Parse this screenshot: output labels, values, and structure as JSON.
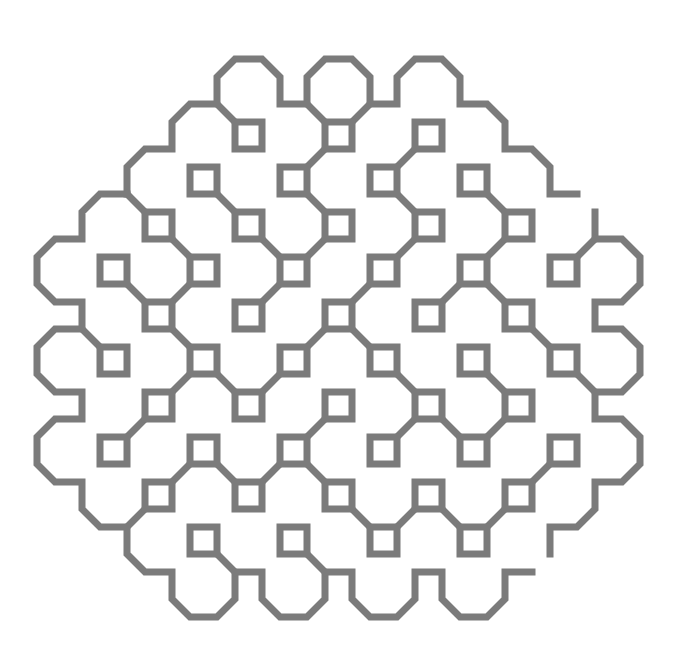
{
  "figure": {
    "type": "space-filling-curve-line-art",
    "colors": {
      "background": "#ffffff",
      "stroke": "#7b7b7b"
    },
    "stroke_width_px": 7,
    "grid": {
      "origin_px": [
        325,
        302
      ],
      "unit_px": 9,
      "square_pitch_units": 5,
      "square_size_units": 3
    },
    "squares": [
      [
        -2,
        -4
      ],
      [
        0,
        -4
      ],
      [
        2,
        -4
      ],
      [
        -3,
        -3
      ],
      [
        -1,
        -3
      ],
      [
        1,
        -3
      ],
      [
        3,
        -3
      ],
      [
        -4,
        -2
      ],
      [
        -2,
        -2
      ],
      [
        0,
        -2
      ],
      [
        2,
        -2
      ],
      [
        4,
        -2
      ],
      [
        -5,
        -1
      ],
      [
        -3,
        -1
      ],
      [
        -1,
        -1
      ],
      [
        1,
        -1
      ],
      [
        3,
        -1
      ],
      [
        5,
        -1
      ],
      [
        -4,
        0
      ],
      [
        -2,
        0
      ],
      [
        0,
        0
      ],
      [
        2,
        0
      ],
      [
        4,
        0
      ],
      [
        -5,
        1
      ],
      [
        -3,
        1
      ],
      [
        -1,
        1
      ],
      [
        1,
        1
      ],
      [
        3,
        1
      ],
      [
        5,
        1
      ],
      [
        -4,
        2
      ],
      [
        -2,
        2
      ],
      [
        0,
        2
      ],
      [
        2,
        2
      ],
      [
        4,
        2
      ],
      [
        -5,
        3
      ],
      [
        -3,
        3
      ],
      [
        -1,
        3
      ],
      [
        1,
        3
      ],
      [
        3,
        3
      ],
      [
        5,
        3
      ],
      [
        -4,
        4
      ],
      [
        -2,
        4
      ],
      [
        0,
        4
      ],
      [
        2,
        4
      ],
      [
        4,
        4
      ],
      [
        -3,
        5
      ],
      [
        -1,
        5
      ],
      [
        1,
        5
      ],
      [
        3,
        5
      ]
    ],
    "connectors": [
      [
        [
          -1,
          -3
        ],
        "TR",
        [
          0,
          -4
        ],
        "BL"
      ],
      [
        [
          1,
          -3
        ],
        "TR",
        [
          2,
          -4
        ],
        "BL"
      ],
      [
        [
          -3,
          -3
        ],
        "BR",
        [
          -2,
          -2
        ],
        "TL"
      ],
      [
        [
          -1,
          -3
        ],
        "BR",
        [
          0,
          -2
        ],
        "TL"
      ],
      [
        [
          1,
          -3
        ],
        "BR",
        [
          2,
          -2
        ],
        "TL"
      ],
      [
        [
          3,
          -3
        ],
        "BR",
        [
          4,
          -2
        ],
        "TL"
      ],
      [
        [
          -4,
          -2
        ],
        "BR",
        [
          -3,
          -1
        ],
        "TL"
      ],
      [
        [
          -2,
          -2
        ],
        "BR",
        [
          -1,
          -1
        ],
        "TL"
      ],
      [
        [
          -1,
          -1
        ],
        "TR",
        [
          0,
          -2
        ],
        "BL"
      ],
      [
        [
          1,
          -1
        ],
        "TR",
        [
          2,
          -2
        ],
        "BL"
      ],
      [
        [
          3,
          -1
        ],
        "TR",
        [
          4,
          -2
        ],
        "BL"
      ],
      [
        [
          -5,
          -1
        ],
        "BR",
        [
          -4,
          0
        ],
        "TL"
      ],
      [
        [
          -4,
          0
        ],
        "TR",
        [
          -3,
          -1
        ],
        "BL"
      ],
      [
        [
          -2,
          0
        ],
        "TR",
        [
          -1,
          -1
        ],
        "BL"
      ],
      [
        [
          0,
          0
        ],
        "TR",
        [
          1,
          -1
        ],
        "BL"
      ],
      [
        [
          2,
          0
        ],
        "TR",
        [
          3,
          -1
        ],
        "BL"
      ],
      [
        [
          3,
          -1
        ],
        "BR",
        [
          4,
          0
        ],
        "TL"
      ],
      [
        [
          -4,
          0
        ],
        "BR",
        [
          -3,
          1
        ],
        "TL"
      ],
      [
        [
          -1,
          1
        ],
        "TR",
        [
          0,
          0
        ],
        "BL"
      ],
      [
        [
          0,
          0
        ],
        "BR",
        [
          1,
          1
        ],
        "TL"
      ],
      [
        [
          4,
          0
        ],
        "BR",
        [
          5,
          1
        ],
        "TL"
      ],
      [
        [
          -3,
          1
        ],
        "BR",
        [
          -2,
          2
        ],
        "TL"
      ],
      [
        [
          -4,
          2
        ],
        "TR",
        [
          -3,
          1
        ],
        "BL"
      ],
      [
        [
          -2,
          2
        ],
        "TR",
        [
          -1,
          1
        ],
        "BL"
      ],
      [
        [
          1,
          1
        ],
        "BR",
        [
          2,
          2
        ],
        "TL"
      ],
      [
        [
          3,
          1
        ],
        "BR",
        [
          4,
          2
        ],
        "TL"
      ],
      [
        [
          -5,
          3
        ],
        "TR",
        [
          -4,
          2
        ],
        "BL"
      ],
      [
        [
          -1,
          3
        ],
        "TR",
        [
          0,
          2
        ],
        "BL"
      ],
      [
        [
          1,
          3
        ],
        "TR",
        [
          2,
          2
        ],
        "BL"
      ],
      [
        [
          2,
          2
        ],
        "BR",
        [
          3,
          3
        ],
        "TL"
      ],
      [
        [
          3,
          3
        ],
        "TR",
        [
          4,
          2
        ],
        "BL"
      ],
      [
        [
          -4,
          4
        ],
        "TR",
        [
          -3,
          3
        ],
        "BL"
      ],
      [
        [
          -3,
          3
        ],
        "BR",
        [
          -2,
          4
        ],
        "TL"
      ],
      [
        [
          -2,
          4
        ],
        "TR",
        [
          -1,
          3
        ],
        "BL"
      ],
      [
        [
          -1,
          3
        ],
        "BR",
        [
          0,
          4
        ],
        "TL"
      ],
      [
        [
          4,
          4
        ],
        "TR",
        [
          5,
          3
        ],
        "BL"
      ],
      [
        [
          0,
          4
        ],
        "BR",
        [
          1,
          5
        ],
        "TL"
      ],
      [
        [
          1,
          5
        ],
        "TR",
        [
          2,
          4
        ],
        "BL"
      ],
      [
        [
          2,
          4
        ],
        "BR",
        [
          3,
          5
        ],
        "TL"
      ],
      [
        [
          3,
          5
        ],
        "TR",
        [
          4,
          4
        ],
        "BL"
      ]
    ],
    "boundary_links": [
      [
        [
          -12,
          -22
        ],
        [
          -10,
          -20
        ]
      ],
      [
        [
          -2,
          -22
        ],
        [
          0,
          -20
        ]
      ],
      [
        [
          5,
          -22
        ],
        [
          3,
          -20
        ]
      ],
      [
        [
          -22,
          -12
        ],
        [
          -20,
          -10
        ]
      ],
      [
        [
          -27,
          3
        ],
        [
          -25,
          5
        ]
      ],
      [
        [
          -22,
          25
        ],
        [
          -20,
          23
        ]
      ],
      [
        [
          -10,
          30
        ],
        [
          -12,
          28
        ]
      ],
      [
        [
          0,
          30
        ],
        [
          -2,
          28
        ]
      ],
      [
        [
          30,
          -7
        ],
        [
          28,
          -5
        ]
      ],
      [
        [
          30,
          10
        ],
        [
          28,
          8
        ]
      ]
    ],
    "boundary_paths": [
      [
        [
          -22,
          -12
        ],
        [
          -22,
          -15
        ],
        [
          -20,
          -17
        ],
        [
          -17,
          -17
        ],
        [
          -17,
          -20
        ],
        [
          -15,
          -22
        ],
        [
          -12,
          -22
        ],
        [
          -12,
          -25
        ],
        [
          -10,
          -27
        ],
        [
          -7,
          -27
        ],
        [
          -5,
          -25
        ],
        [
          -5,
          -22
        ],
        [
          -2,
          -22
        ],
        [
          -2,
          -25
        ],
        [
          0,
          -27
        ],
        [
          3,
          -27
        ],
        [
          5,
          -25
        ],
        [
          5,
          -22
        ],
        [
          8,
          -22
        ],
        [
          8,
          -25
        ],
        [
          10,
          -27
        ],
        [
          13,
          -27
        ],
        [
          15,
          -25
        ],
        [
          15,
          -22
        ],
        [
          18,
          -22
        ],
        [
          20,
          -20
        ],
        [
          20,
          -17
        ],
        [
          23,
          -17
        ],
        [
          25,
          -15
        ],
        [
          25,
          -12
        ],
        [
          28,
          -12
        ]
      ],
      [
        [
          -22,
          -12
        ],
        [
          -25,
          -12
        ],
        [
          -27,
          -10
        ],
        [
          -27,
          -7
        ],
        [
          -30,
          -7
        ],
        [
          -32,
          -5
        ],
        [
          -32,
          -2
        ],
        [
          -30,
          0
        ],
        [
          -27,
          0
        ],
        [
          -27,
          3
        ],
        [
          -30,
          3
        ],
        [
          -32,
          5
        ],
        [
          -32,
          8
        ],
        [
          -30,
          10
        ],
        [
          -27,
          10
        ],
        [
          -27,
          13
        ],
        [
          -30,
          13
        ],
        [
          -32,
          15
        ],
        [
          -32,
          18
        ],
        [
          -30,
          20
        ],
        [
          -27,
          20
        ],
        [
          -27,
          23
        ],
        [
          -25,
          25
        ],
        [
          -22,
          25
        ],
        [
          -22,
          28
        ],
        [
          -20,
          30
        ],
        [
          -17,
          30
        ],
        [
          -17,
          33
        ],
        [
          -15,
          35
        ],
        [
          -12,
          35
        ],
        [
          -10,
          33
        ],
        [
          -10,
          30
        ],
        [
          -7,
          30
        ],
        [
          -7,
          33
        ],
        [
          -5,
          35
        ],
        [
          -2,
          35
        ],
        [
          0,
          33
        ],
        [
          0,
          30
        ],
        [
          3,
          30
        ],
        [
          3,
          33
        ],
        [
          5,
          35
        ],
        [
          8,
          35
        ],
        [
          10,
          33
        ],
        [
          10,
          30
        ],
        [
          13,
          30
        ],
        [
          13,
          33
        ],
        [
          15,
          35
        ],
        [
          18,
          35
        ],
        [
          20,
          33
        ],
        [
          20,
          30
        ],
        [
          23,
          30
        ]
      ],
      [
        [
          30,
          -10
        ],
        [
          30,
          -7
        ],
        [
          33,
          -7
        ],
        [
          35,
          -5
        ],
        [
          35,
          -2
        ],
        [
          33,
          0
        ],
        [
          30,
          0
        ],
        [
          30,
          3
        ],
        [
          33,
          3
        ],
        [
          35,
          5
        ],
        [
          35,
          8
        ],
        [
          33,
          10
        ],
        [
          30,
          10
        ],
        [
          30,
          13
        ],
        [
          33,
          13
        ],
        [
          35,
          15
        ],
        [
          35,
          18
        ],
        [
          33,
          20
        ],
        [
          30,
          20
        ],
        [
          30,
          23
        ],
        [
          28,
          25
        ],
        [
          25,
          25
        ],
        [
          25,
          28
        ]
      ]
    ]
  }
}
